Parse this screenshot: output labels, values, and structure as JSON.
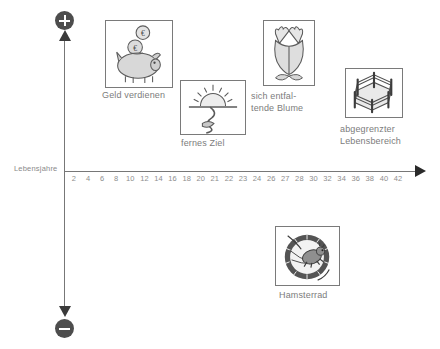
{
  "diagram": {
    "axis": {
      "x_title": "Lebensjahre",
      "ticks": [
        "2",
        "4",
        "6",
        "8",
        "10",
        "12",
        "14",
        "16",
        "18",
        "20",
        "21",
        "22",
        "23",
        "24",
        "26",
        "27",
        "28",
        "30",
        "32",
        "34",
        "36",
        "38",
        "40",
        "42"
      ],
      "positive_symbol": "+",
      "negative_symbol": "−"
    },
    "cards": [
      {
        "id": "money",
        "icon": "piggy-bank-icon",
        "caption": "Geld verdienen"
      },
      {
        "id": "goal",
        "icon": "sunrise-path-icon",
        "caption": "fernes Ziel"
      },
      {
        "id": "flower",
        "icon": "tulip-flower-icon",
        "caption": "sich entfal-\ntende Blume"
      },
      {
        "id": "fence",
        "icon": "fenced-area-icon",
        "caption": "abgegrenzter\nLebensbereich"
      },
      {
        "id": "wheel",
        "icon": "hamster-wheel-icon",
        "caption": "Hamsterrad"
      }
    ],
    "colors": {
      "axis": "#777777",
      "text": "#7c7c7c",
      "badge": "#4d4d4d",
      "card_border": "#7a7a7a"
    }
  },
  "chart_data": {
    "type": "scatter",
    "title": "",
    "xlabel": "Lebensjahre",
    "ylabel": "",
    "xlim": [
      0,
      44
    ],
    "ylim": [
      -1,
      1
    ],
    "grid": false,
    "legend": "none",
    "x_ticks": [
      2,
      4,
      6,
      8,
      10,
      12,
      14,
      16,
      18,
      20,
      21,
      22,
      23,
      24,
      26,
      27,
      28,
      30,
      32,
      34,
      36,
      38,
      40,
      42
    ],
    "y_axis_annotations": [
      "+",
      "−"
    ],
    "points": [
      {
        "label": "Geld verdienen",
        "x": 8,
        "y": 0.75,
        "valence": "positive"
      },
      {
        "label": "fernes Ziel",
        "x": 20,
        "y": 0.42,
        "valence": "positive"
      },
      {
        "label": "sich entfaltende Blume",
        "x": 28,
        "y": 0.78,
        "valence": "positive"
      },
      {
        "label": "abgegrenzter Lebensbereich",
        "x": 38,
        "y": 0.55,
        "valence": "positive"
      },
      {
        "label": "Hamsterrad",
        "x": 30,
        "y": -0.55,
        "valence": "negative"
      }
    ]
  }
}
